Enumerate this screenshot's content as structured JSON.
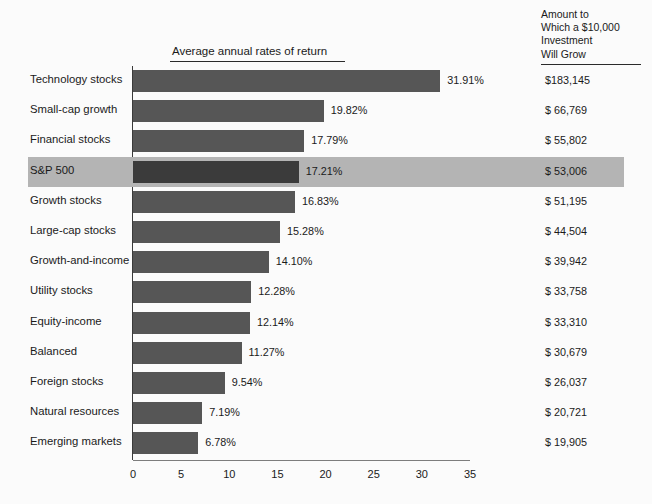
{
  "header": {
    "amount_column_title": "Amount to\nWhich a $10,000\nInvestment\nWill Grow",
    "chart_title": "Average annual rates of return"
  },
  "colors": {
    "bar": "#565656",
    "bar_highlighted": "#3b3b3b",
    "row_highlight_band": "#b4b4b4",
    "axis": "#7d7d7d",
    "text": "#1a1a1a",
    "background": "#fbfbfb"
  },
  "chart_data": {
    "type": "bar",
    "orientation": "horizontal",
    "title": "Average annual rates of return",
    "xlabel": "",
    "ylabel": "",
    "xlim": [
      0,
      35
    ],
    "grid": false,
    "legend": "none",
    "xticks": [
      "0",
      "5",
      "10",
      "15",
      "20",
      "25",
      "30",
      "35"
    ],
    "xtick_values": [
      0,
      5,
      10,
      15,
      20,
      25,
      30,
      35
    ],
    "categories": [
      "Technology stocks",
      "Small-cap growth",
      "Financial stocks",
      "S&P 500",
      "Growth stocks",
      "Large-cap stocks",
      "Growth-and-income",
      "Utility stocks",
      "Equity-income",
      "Balanced",
      "Foreign stocks",
      "Natural resources",
      "Emerging markets"
    ],
    "values": [
      31.91,
      19.82,
      17.79,
      17.21,
      16.83,
      15.28,
      14.1,
      12.28,
      12.14,
      11.27,
      9.54,
      7.19,
      6.78
    ],
    "value_labels": [
      "31.91%",
      "19.82%",
      "17.79%",
      "17.21%",
      "16.83%",
      "15.28%",
      "14.10%",
      "12.28%",
      "12.14%",
      "11.27%",
      "9.54%",
      "7.19%",
      "6.78%"
    ],
    "secondary_column": {
      "name": "Amount to Which a $10,000 Investment Will Grow",
      "labels": [
        "$183,145",
        "$ 66,769",
        "$ 55,802",
        "$ 53,006",
        "$ 51,195",
        "$ 44,504",
        "$ 39,942",
        "$ 33,758",
        "$ 33,310",
        "$ 30,679",
        "$ 26,037",
        "$ 20,721",
        "$ 19,905"
      ],
      "values": [
        183145,
        66769,
        55802,
        53006,
        51195,
        44504,
        39942,
        33758,
        33310,
        30679,
        26037,
        20721,
        19905
      ]
    },
    "highlighted_index": 3
  },
  "rows": [
    {
      "label": "Technology stocks",
      "value": 31.91,
      "value_label": "31.91%",
      "amount": "$183,145",
      "highlighted": false
    },
    {
      "label": "Small-cap growth",
      "value": 19.82,
      "value_label": "19.82%",
      "amount": "$ 66,769",
      "highlighted": false
    },
    {
      "label": "Financial stocks",
      "value": 17.79,
      "value_label": "17.79%",
      "amount": "$ 55,802",
      "highlighted": false
    },
    {
      "label": "S&P 500",
      "value": 17.21,
      "value_label": "17.21%",
      "amount": "$ 53,006",
      "highlighted": true
    },
    {
      "label": "Growth stocks",
      "value": 16.83,
      "value_label": "16.83%",
      "amount": "$ 51,195",
      "highlighted": false
    },
    {
      "label": "Large-cap stocks",
      "value": 15.28,
      "value_label": "15.28%",
      "amount": "$ 44,504",
      "highlighted": false
    },
    {
      "label": "Growth-and-income",
      "value": 14.1,
      "value_label": "14.10%",
      "amount": "$ 39,942",
      "highlighted": false
    },
    {
      "label": "Utility stocks",
      "value": 12.28,
      "value_label": "12.28%",
      "amount": "$ 33,758",
      "highlighted": false
    },
    {
      "label": "Equity-income",
      "value": 12.14,
      "value_label": "12.14%",
      "amount": "$ 33,310",
      "highlighted": false
    },
    {
      "label": "Balanced",
      "value": 11.27,
      "value_label": "11.27%",
      "amount": "$ 30,679",
      "highlighted": false
    },
    {
      "label": "Foreign stocks",
      "value": 9.54,
      "value_label": "9.54%",
      "amount": "$ 26,037",
      "highlighted": false
    },
    {
      "label": "Natural resources",
      "value": 7.19,
      "value_label": "7.19%",
      "amount": "$ 20,721",
      "highlighted": false
    },
    {
      "label": "Emerging markets",
      "value": 6.78,
      "value_label": "6.78%",
      "amount": "$ 19,905",
      "highlighted": false
    }
  ],
  "axis": {
    "ticks": [
      "0",
      "5",
      "10",
      "15",
      "20",
      "25",
      "30",
      "35"
    ]
  }
}
